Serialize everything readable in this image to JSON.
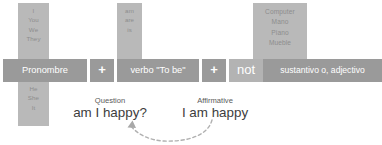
{
  "diagram": {
    "colors": {
      "block_dark": "#9a9a9a",
      "block_light": "#b3b3b3",
      "column_block": "#b9b9b9",
      "column_text": "#8d8d8d",
      "segment_text": "#ffffff",
      "example_text": "#3d3d3d",
      "arrow": "#b0b0b0",
      "background": "#ffffff"
    },
    "formula": {
      "segments": [
        {
          "id": "pronombre",
          "label": "Pronombre",
          "kind": "term"
        },
        {
          "id": "plus1",
          "label": "+",
          "kind": "operator"
        },
        {
          "id": "verbo",
          "label": "verbo \"To be\"",
          "kind": "term"
        },
        {
          "id": "plus2",
          "label": "+",
          "kind": "operator"
        },
        {
          "id": "not",
          "label": "not",
          "kind": "optional"
        },
        {
          "id": "sustantivo",
          "label": "sustantivo o, adjectivo",
          "kind": "term"
        }
      ]
    },
    "columns": {
      "pronouns_upper": [
        "I",
        "You",
        "We",
        "They"
      ],
      "pronouns_lower": [
        "He",
        "She",
        "It"
      ],
      "verb_forms": [
        "am",
        "are",
        "is"
      ],
      "nouns": [
        "Computer",
        "Mano",
        "Piano",
        "Mueble"
      ]
    },
    "examples": [
      {
        "id": "question",
        "label": "Question",
        "sentence": "am I happy?"
      },
      {
        "id": "affirmative",
        "label": "Affirmative",
        "sentence": "I am happy"
      }
    ],
    "arrow": {
      "name": "curved-dashed-arrow",
      "direction": "right-to-left",
      "meaning": "affirmative transforms into question"
    }
  }
}
